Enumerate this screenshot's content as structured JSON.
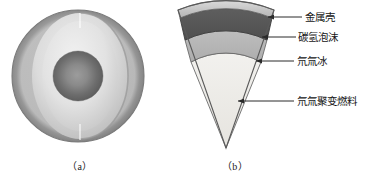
{
  "figure": {
    "panels": [
      {
        "id": "a",
        "caption": "（a）",
        "description": "cutaway-sphere"
      },
      {
        "id": "b",
        "caption": "（b）",
        "description": "wedge-cross-section"
      }
    ]
  },
  "labels": [
    {
      "text": "金属壳",
      "layer": "metal-shell",
      "color": "#a9a9a9"
    },
    {
      "text": "碳氢泡沫",
      "layer": "hydrocarbon-foam",
      "color": "#565656"
    },
    {
      "text": "氘氚冰",
      "layer": "deuterium-tritium-ice",
      "color": "#b5b5b5"
    },
    {
      "text": "氘氚聚变燃料",
      "layer": "dt-fusion-fuel",
      "color": "#eceae6"
    }
  ],
  "colors": {
    "metal_shell": "#a9a9a9",
    "metal_shell_light": "#d6d6d6",
    "foam": "#565656",
    "ice": "#b5b5b5",
    "fuel": "#ecebe7",
    "outline": "#4a4a4a",
    "leader": "#2a2a2a",
    "sphere_rim_dark": "#8d8d8d",
    "sphere_shell": "#cfcfcf",
    "sphere_cut_face": "#dcdcdc",
    "sphere_core": "#6f6f6f",
    "background": "#ffffff"
  }
}
